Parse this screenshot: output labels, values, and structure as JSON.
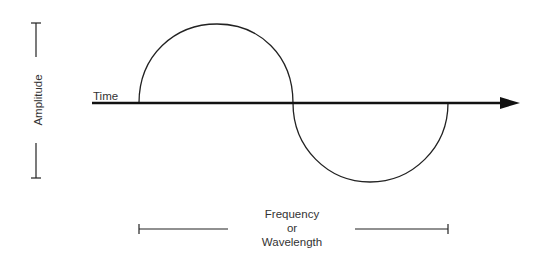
{
  "diagram": {
    "labels": {
      "time": "Time",
      "amplitude": "Amplitude",
      "frequency_line1": "Frequency",
      "frequency_line2": "or",
      "frequency_line3": "Wavelength"
    },
    "colors": {
      "stroke": "#222222",
      "text": "#333333",
      "background": "#ffffff"
    },
    "elements": {
      "time_axis": {
        "x_start": 92,
        "x_end": 519,
        "y": 103,
        "arrow": true
      },
      "upper_arc": {
        "x_start": 139,
        "x_end": 293,
        "peak_y": 24
      },
      "lower_arc": {
        "x_start": 293,
        "x_end": 448,
        "trough_y": 182
      },
      "amplitude_bracket": {
        "x": 36,
        "y_top": 23,
        "y_bottom": 178
      },
      "frequency_bracket": {
        "y": 229,
        "x_left": 139,
        "x_right": 448
      }
    }
  }
}
